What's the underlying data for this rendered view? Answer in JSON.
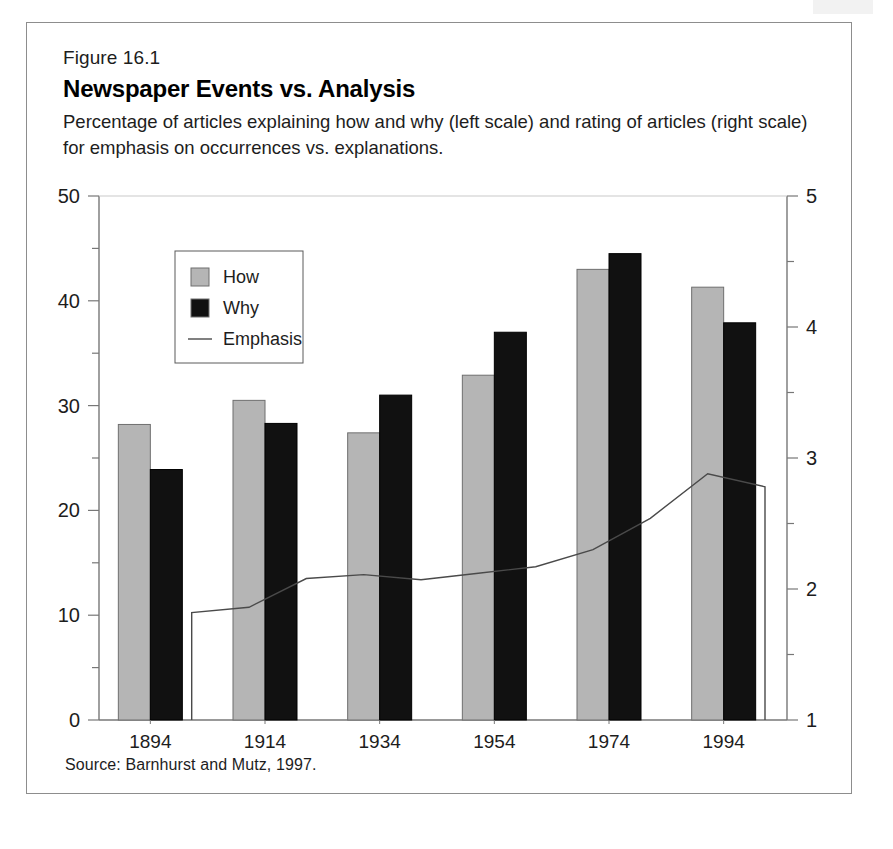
{
  "figure": {
    "number": "Figure 16.1",
    "title": "Newspaper Events vs. Analysis",
    "subtitle": "Percentage of articles explaining how and why (left scale) and rating of articles (right scale) for emphasis on occurrences vs. explanations.",
    "source": "Source: Barnhurst and Mutz, 1997."
  },
  "colors": {
    "how_bar": "#b5b5b5",
    "why_bar": "#111111",
    "line": "#4a4a4a",
    "axis": "#777777",
    "frame": "#8d8d8d",
    "text": "#1d1d1d"
  },
  "legend": {
    "items": [
      {
        "label": "How",
        "type": "swatch",
        "color": "#b5b5b5"
      },
      {
        "label": "Why",
        "type": "swatch",
        "color": "#111111"
      },
      {
        "label": "Emphasis",
        "type": "line",
        "color": "#4a4a4a"
      }
    ]
  },
  "chart_data": {
    "type": "bar",
    "title": "Newspaper Events vs. Analysis",
    "subtitle": "Percentage of articles explaining how and why (left scale) and rating of articles (right scale) for emphasis on occurrences vs. explanations.",
    "xlabel": "",
    "ylabel": "",
    "categories": [
      "1894",
      "1914",
      "1934",
      "1954",
      "1974",
      "1994"
    ],
    "series": [
      {
        "name": "How",
        "axis": "left",
        "type": "bar",
        "values": [
          28.2,
          30.5,
          27.4,
          32.9,
          43.0,
          41.3
        ]
      },
      {
        "name": "Why",
        "axis": "left",
        "type": "bar",
        "values": [
          23.9,
          28.3,
          31.0,
          37.0,
          44.5,
          37.9
        ]
      },
      {
        "name": "Emphasis",
        "axis": "right",
        "type": "line",
        "x": [
          1904,
          1914,
          1924,
          1934,
          1944,
          1954,
          1964,
          1974,
          1984,
          1994,
          2004
        ],
        "values": [
          1.82,
          1.86,
          2.08,
          2.11,
          2.07,
          2.12,
          2.17,
          2.3,
          2.54,
          2.88,
          2.78
        ]
      }
    ],
    "left_axis": {
      "min": 0,
      "max": 50,
      "ticks": [
        0,
        10,
        20,
        30,
        40,
        50
      ],
      "minor_step": 5
    },
    "right_axis": {
      "min": 1,
      "max": 5,
      "ticks": [
        1,
        2,
        3,
        4,
        5
      ],
      "minor_step": 0.5
    },
    "grid": false,
    "legend_position": "inside-upper-left"
  },
  "axes": {
    "left_ticks": [
      "50",
      "40",
      "30",
      "20",
      "10",
      "0"
    ],
    "right_ticks": [
      "5",
      "4",
      "3",
      "2",
      "1"
    ],
    "x_ticks": [
      "1894",
      "1914",
      "1934",
      "1954",
      "1974",
      "1994"
    ]
  }
}
